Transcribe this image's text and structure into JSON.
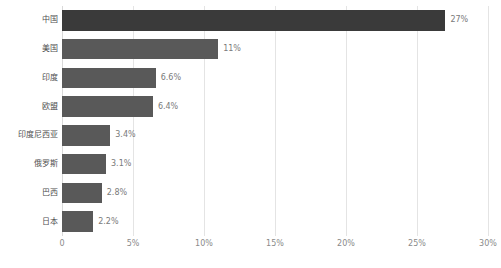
{
  "chart_data": {
    "type": "bar",
    "orientation": "horizontal",
    "title": "各国二氧化碳排放量统计图",
    "title_clipped": true,
    "xlabel": "",
    "ylabel": "",
    "xlim": [
      0,
      30
    ],
    "grid": true,
    "legend": "none",
    "categories": [
      "中国",
      "美国",
      "印度",
      "欧盟",
      "印度尼西亚",
      "俄罗斯",
      "巴西",
      "日本"
    ],
    "values": [
      27,
      11,
      6.6,
      6.4,
      3.4,
      3.1,
      2.8,
      2.2
    ],
    "value_labels": [
      "27%",
      "11%",
      "6.6%",
      "6.4%",
      "3.4%",
      "3.1%",
      "2.8%",
      "2.2%"
    ],
    "xticks": [
      0,
      5,
      10,
      15,
      20,
      25,
      30
    ],
    "xtick_labels": [
      "0",
      "5%",
      "10%",
      "15%",
      "20%",
      "25%",
      "30%"
    ],
    "colors": {
      "bar_default": "#595959",
      "bar_highlight": "#3a3a3a",
      "gridline": "#e4e4e4",
      "axis": "#d9d9d9",
      "label_text": "#4f4f4f",
      "value_text": "#7a7a7a",
      "tick_text": "#8a8a8a",
      "background": "#ffffff"
    },
    "highlight_index": 0
  }
}
